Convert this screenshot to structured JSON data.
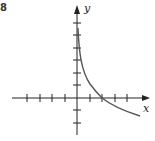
{
  "exercise_number": "8",
  "axes": {
    "x_label": "x",
    "y_label": "y"
  },
  "graph": {
    "origin_px": [
      77,
      98
    ],
    "unit_px": 12.5,
    "x_ticks": [
      -4,
      -3,
      -2,
      -1,
      1,
      2,
      3,
      4
    ],
    "y_ticks": [
      -2,
      -1,
      1,
      2,
      3,
      4,
      5
    ],
    "curve_description": "decreasing logarithmic-type curve, vertical asymptote at x=0, crossing x-axis at x=2"
  },
  "colors": {
    "axis": "#222222",
    "curve": "#555555"
  }
}
